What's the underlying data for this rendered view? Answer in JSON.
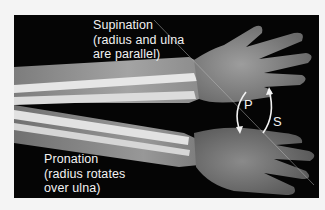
{
  "figure": {
    "labels": {
      "supination": [
        "Supination",
        "(radius and ulna",
        "are parallel)"
      ],
      "pronation": [
        "Pronation",
        "(radius rotates",
        "over ulna)"
      ],
      "arrow_p": "P",
      "arrow_s": "S"
    },
    "colors": {
      "background": "#050505",
      "page": "#f4f4f4",
      "text": "#f2f2f2"
    }
  }
}
